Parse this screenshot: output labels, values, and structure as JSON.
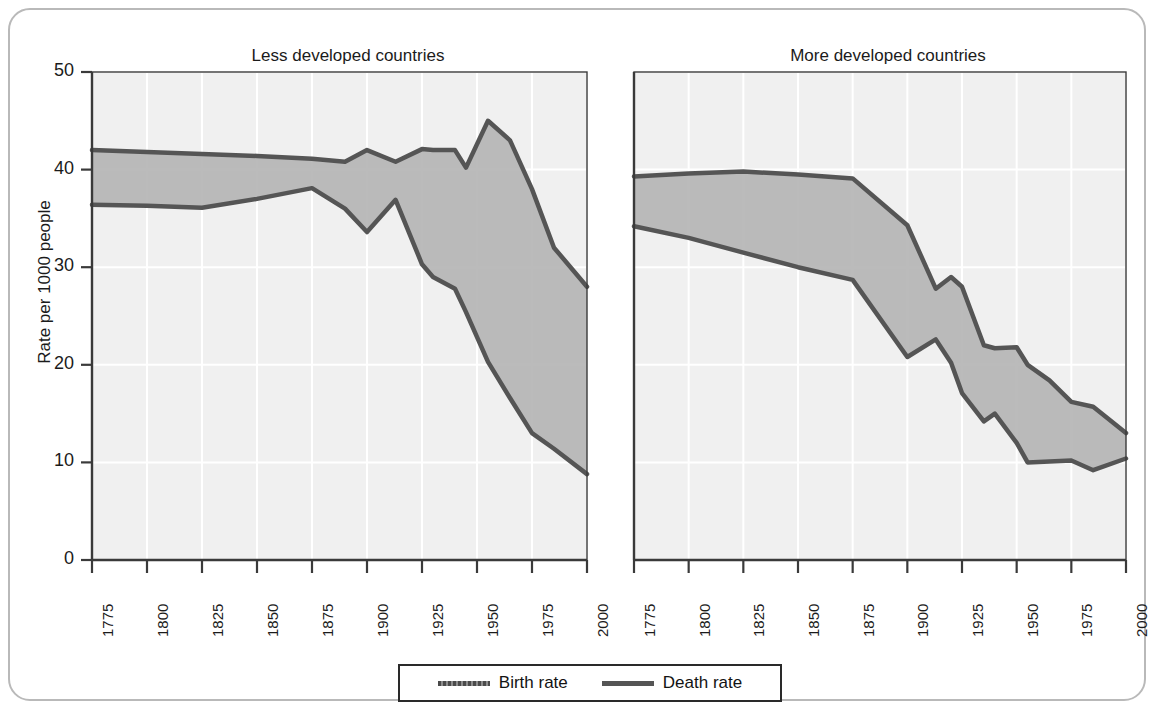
{
  "ylabel": "Rate per 1000 people",
  "yticks": [
    0,
    10,
    20,
    30,
    40,
    50
  ],
  "xticks": [
    "1775",
    "1800",
    "1825",
    "1850",
    "1875",
    "1900",
    "1925",
    "1950",
    "1975",
    "2000"
  ],
  "legend": {
    "birth_label": "Birth rate",
    "death_label": "Death rate"
  },
  "colors": {
    "line": "#555555",
    "fill": "#b5b5b5",
    "plot_background": "#f0f0f0",
    "grid": "#ffffff",
    "axis": "#3a3a3a",
    "frame": "#b9b9b9",
    "text": "#1b1b1b"
  },
  "chart_data": [
    {
      "type": "area",
      "title": "Less developed countries",
      "xlabel": "",
      "ylabel": "Rate per 1000 people",
      "ylim": [
        0,
        50
      ],
      "xlim": [
        1775,
        2000
      ],
      "grid": true,
      "legend_position": "bottom-center",
      "annotation": "Natural\nincrease",
      "x": [
        1775,
        1800,
        1825,
        1850,
        1875,
        1890,
        1900,
        1913,
        1925,
        1930,
        1940,
        1945,
        1955,
        1965,
        1975,
        1985,
        2000
      ],
      "series": [
        {
          "name": "Birth rate",
          "values": [
            42.0,
            41.8,
            41.6,
            41.4,
            41.1,
            40.8,
            42.0,
            40.8,
            42.1,
            42.0,
            42.0,
            40.2,
            45.0,
            43.0,
            38.0,
            32.0,
            28.0
          ]
        },
        {
          "name": "Death rate",
          "values": [
            36.4,
            36.3,
            36.1,
            37.0,
            38.1,
            36.0,
            33.6,
            36.9,
            30.3,
            29.0,
            27.8,
            25.4,
            20.3,
            16.6,
            13.0,
            11.4,
            8.8
          ]
        }
      ]
    },
    {
      "type": "area",
      "title": "More developed countries",
      "xlabel": "",
      "ylabel": "Rate per 1000 people",
      "ylim": [
        0,
        50
      ],
      "xlim": [
        1775,
        2000
      ],
      "grid": true,
      "legend_position": "bottom-center",
      "annotation": "Natural increase",
      "x": [
        1775,
        1800,
        1825,
        1850,
        1875,
        1900,
        1913,
        1920,
        1925,
        1935,
        1940,
        1950,
        1955,
        1965,
        1975,
        1985,
        2000
      ],
      "series": [
        {
          "name": "Birth rate",
          "values": [
            39.3,
            39.6,
            39.8,
            39.5,
            39.1,
            34.3,
            27.8,
            29.0,
            28.0,
            22.0,
            21.7,
            21.8,
            20.0,
            18.4,
            16.2,
            15.7,
            13.0
          ]
        },
        {
          "name": "Death rate",
          "values": [
            34.2,
            33.0,
            31.5,
            30.0,
            28.7,
            20.8,
            22.6,
            20.2,
            17.1,
            14.2,
            15.0,
            12.0,
            10.0,
            10.1,
            10.2,
            9.2,
            10.4
          ]
        }
      ]
    }
  ]
}
